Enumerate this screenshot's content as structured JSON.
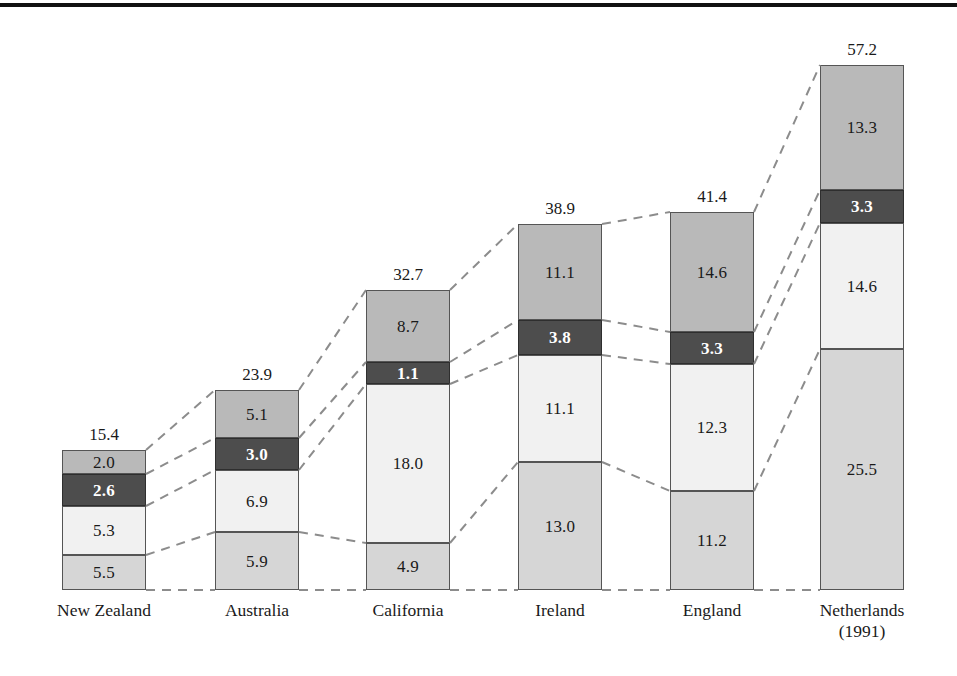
{
  "figure": {
    "top_rule": true,
    "background": "#ffffff"
  },
  "palette": {
    "tone_medium": "#b9b9b9",
    "tone_dark": "#4d4d4d",
    "tone_pale": "#f1f1f1",
    "tone_light": "#d6d6d6",
    "outline": "#555555",
    "connector": "#8c8c8c",
    "text": "#1a1a1a",
    "text_on_dark": "#ffffff"
  },
  "chart_data": {
    "type": "bar",
    "subtype": "stacked-bar-with-connectors",
    "title": "",
    "subtitle": "",
    "xlabel": "",
    "ylabel": "",
    "grid": false,
    "legend": "none",
    "axis_baseline": "dashed",
    "ylim": [
      0,
      57.2
    ],
    "categories": [
      "New Zealand",
      "Australia",
      "California",
      "Ireland",
      "England",
      "Netherlands"
    ],
    "category_sublabels": [
      "",
      "",
      "",
      "",
      "",
      "(1991)"
    ],
    "stack_order": "bottom-to-top",
    "series": [
      {
        "name": "segment-bottom",
        "tone": "tone-light",
        "values": [
          5.5,
          5.9,
          4.9,
          13.0,
          11.2,
          25.5
        ]
      },
      {
        "name": "segment-lower",
        "tone": "tone-pale",
        "values": [
          5.3,
          6.9,
          18.0,
          11.1,
          12.3,
          14.6
        ]
      },
      {
        "name": "segment-upper",
        "tone": "tone-dark",
        "values": [
          2.6,
          3.0,
          1.1,
          3.8,
          3.3,
          3.3
        ]
      },
      {
        "name": "segment-top",
        "tone": "tone-medium",
        "values": [
          2.0,
          5.1,
          8.7,
          11.1,
          14.6,
          13.3
        ]
      }
    ],
    "totals": [
      15.4,
      23.9,
      32.7,
      38.9,
      41.4,
      57.2
    ],
    "value_label_format": "one-decimal"
  },
  "bars": [
    {
      "category": "New Zealand",
      "sublabel": "",
      "total": "15.4",
      "x": 62,
      "width": 84,
      "segments": [
        {
          "label": "2.0",
          "tone": "tone-medium",
          "top": 450,
          "height": 24
        },
        {
          "label": "2.6",
          "tone": "tone-dark",
          "top": 474,
          "height": 32
        },
        {
          "label": "5.3",
          "tone": "tone-pale",
          "top": 506,
          "height": 49
        },
        {
          "label": "5.5",
          "tone": "tone-light",
          "top": 555,
          "height": 35
        }
      ]
    },
    {
      "category": "Australia",
      "sublabel": "",
      "total": "23.9",
      "x": 215,
      "width": 84,
      "segments": [
        {
          "label": "5.1",
          "tone": "tone-medium",
          "top": 390,
          "height": 48
        },
        {
          "label": "3.0",
          "tone": "tone-dark",
          "top": 438,
          "height": 32
        },
        {
          "label": "6.9",
          "tone": "tone-pale",
          "top": 470,
          "height": 62
        },
        {
          "label": "5.9",
          "tone": "tone-light",
          "top": 532,
          "height": 58
        }
      ]
    },
    {
      "category": "California",
      "sublabel": "",
      "total": "32.7",
      "x": 366,
      "width": 84,
      "segments": [
        {
          "label": "8.7",
          "tone": "tone-medium",
          "top": 290,
          "height": 72
        },
        {
          "label": "1.1",
          "tone": "tone-dark",
          "top": 362,
          "height": 22
        },
        {
          "label": "18.0",
          "tone": "tone-pale",
          "top": 384,
          "height": 159
        },
        {
          "label": "4.9",
          "tone": "tone-light",
          "top": 543,
          "height": 47
        }
      ]
    },
    {
      "category": "Ireland",
      "sublabel": "",
      "total": "38.9",
      "x": 518,
      "width": 84,
      "segments": [
        {
          "label": "11.1",
          "tone": "tone-medium",
          "top": 224,
          "height": 96
        },
        {
          "label": "3.8",
          "tone": "tone-dark",
          "top": 320,
          "height": 35
        },
        {
          "label": "11.1",
          "tone": "tone-pale",
          "top": 355,
          "height": 107
        },
        {
          "label": "13.0",
          "tone": "tone-light",
          "top": 462,
          "height": 128
        }
      ]
    },
    {
      "category": "England",
      "sublabel": "",
      "total": "41.4",
      "x": 670,
      "width": 84,
      "segments": [
        {
          "label": "14.6",
          "tone": "tone-medium",
          "top": 212,
          "height": 120
        },
        {
          "label": "3.3",
          "tone": "tone-dark",
          "top": 332,
          "height": 32
        },
        {
          "label": "12.3",
          "tone": "tone-pale",
          "top": 364,
          "height": 127
        },
        {
          "label": "11.2",
          "tone": "tone-light",
          "top": 491,
          "height": 99
        }
      ]
    },
    {
      "category": "Netherlands",
      "sublabel": "(1991)",
      "total": "57.2",
      "x": 820,
      "width": 84,
      "segments": [
        {
          "label": "13.3",
          "tone": "tone-medium",
          "top": 65,
          "height": 125
        },
        {
          "label": "3.3",
          "tone": "tone-dark",
          "top": 190,
          "height": 33
        },
        {
          "label": "14.6",
          "tone": "tone-pale",
          "top": 223,
          "height": 126
        },
        {
          "label": "25.5",
          "tone": "tone-light",
          "top": 349,
          "height": 241
        }
      ]
    }
  ]
}
